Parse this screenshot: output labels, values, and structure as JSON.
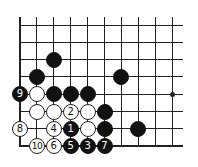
{
  "diagram": {
    "type": "go-board-fragment",
    "grid": {
      "origin_x": 20,
      "origin_y": 25,
      "spacing_x": 16.9,
      "spacing_y": 17.3,
      "cols": 10,
      "rows": 8,
      "line_right": 183,
      "line_top": 17,
      "left_edge": true,
      "bottom_edge": true
    },
    "star_points": [
      {
        "col": 9,
        "row": 4
      }
    ],
    "stones": [
      {
        "color": "black",
        "col": 2,
        "row": 2,
        "label": ""
      },
      {
        "color": "black",
        "col": 1,
        "row": 3,
        "label": ""
      },
      {
        "color": "black",
        "col": 6,
        "row": 3,
        "label": ""
      },
      {
        "color": "black",
        "col": 0,
        "row": 4,
        "label": "9"
      },
      {
        "color": "white",
        "col": 1,
        "row": 4,
        "label": ""
      },
      {
        "color": "black",
        "col": 2,
        "row": 4,
        "label": ""
      },
      {
        "color": "black",
        "col": 3,
        "row": 4,
        "label": ""
      },
      {
        "color": "black",
        "col": 4,
        "row": 4,
        "label": ""
      },
      {
        "color": "white",
        "col": 1,
        "row": 5,
        "label": ""
      },
      {
        "color": "white",
        "col": 2,
        "row": 5,
        "label": ""
      },
      {
        "color": "white",
        "col": 3,
        "row": 5,
        "label": "2"
      },
      {
        "color": "white",
        "col": 4,
        "row": 5,
        "label": ""
      },
      {
        "color": "black",
        "col": 5,
        "row": 5,
        "label": ""
      },
      {
        "color": "white",
        "col": 0,
        "row": 6,
        "label": "8"
      },
      {
        "color": "white",
        "col": 2,
        "row": 6,
        "label": "4"
      },
      {
        "color": "black",
        "col": 3,
        "row": 6,
        "label": "1"
      },
      {
        "color": "white",
        "col": 4,
        "row": 6,
        "label": ""
      },
      {
        "color": "black",
        "col": 5,
        "row": 6,
        "label": ""
      },
      {
        "color": "black",
        "col": 7,
        "row": 6,
        "label": ""
      },
      {
        "color": "white",
        "col": 1,
        "row": 7,
        "label": "10"
      },
      {
        "color": "white",
        "col": 2,
        "row": 7,
        "label": "6"
      },
      {
        "color": "black",
        "col": 3,
        "row": 7,
        "label": "5"
      },
      {
        "color": "black",
        "col": 4,
        "row": 7,
        "label": "3"
      },
      {
        "color": "black",
        "col": 5,
        "row": 7,
        "label": "7"
      }
    ]
  }
}
